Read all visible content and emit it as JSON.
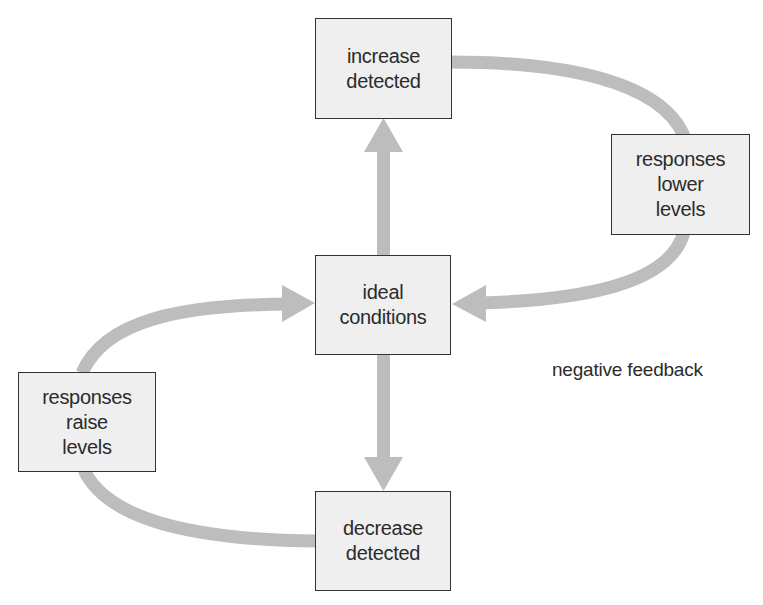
{
  "diagram": {
    "title": "negative feedback",
    "colors": {
      "arrow": "#bdbdbd",
      "box_fill": "#efefef",
      "box_border": "#333333",
      "text": "#2b2b2b"
    },
    "nodes": {
      "increase": {
        "lines": [
          "increase",
          "detected"
        ]
      },
      "ideal": {
        "lines": [
          "ideal",
          "conditions"
        ]
      },
      "decrease": {
        "lines": [
          "decrease",
          "detected"
        ]
      },
      "lower": {
        "lines": [
          "responses",
          "lower",
          "levels"
        ]
      },
      "raise": {
        "lines": [
          "responses",
          "raise",
          "levels"
        ]
      }
    },
    "edges": [
      {
        "from": "ideal conditions",
        "to": "increase detected"
      },
      {
        "from": "increase detected",
        "to": "responses lower levels"
      },
      {
        "from": "responses lower levels",
        "to": "ideal conditions"
      },
      {
        "from": "ideal conditions",
        "to": "decrease detected"
      },
      {
        "from": "decrease detected",
        "to": "responses raise levels"
      },
      {
        "from": "responses raise levels",
        "to": "ideal conditions"
      }
    ]
  }
}
